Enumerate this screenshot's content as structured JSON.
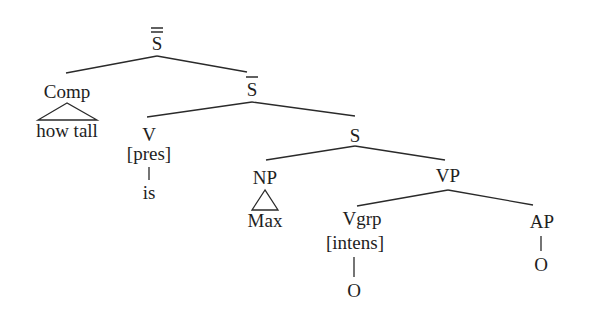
{
  "diagram": {
    "type": "syntax-tree",
    "nodes": {
      "root": {
        "label": "S",
        "bars": 2
      },
      "comp": {
        "label": "Comp"
      },
      "comp_leaf": {
        "label": "how tall",
        "roof": true
      },
      "sbar": {
        "label": "S",
        "bars": 1
      },
      "v": {
        "label": "V"
      },
      "v_feature": {
        "label": "[pres]"
      },
      "v_leaf": {
        "label": "is"
      },
      "s": {
        "label": "S"
      },
      "np": {
        "label": "NP"
      },
      "np_leaf": {
        "label": "Max",
        "roof": true
      },
      "vp": {
        "label": "VP"
      },
      "vgrp": {
        "label": "Vgrp"
      },
      "vgrp_feature": {
        "label": "[intens]"
      },
      "vgrp_leaf": {
        "label": "O"
      },
      "ap": {
        "label": "AP"
      },
      "ap_leaf": {
        "label": "O"
      }
    },
    "edges": [
      [
        "root",
        "comp"
      ],
      [
        "root",
        "sbar"
      ],
      [
        "comp",
        "comp_leaf"
      ],
      [
        "sbar",
        "v"
      ],
      [
        "sbar",
        "s"
      ],
      [
        "v",
        "v_leaf"
      ],
      [
        "s",
        "np"
      ],
      [
        "s",
        "vp"
      ],
      [
        "np",
        "np_leaf"
      ],
      [
        "vp",
        "vgrp"
      ],
      [
        "vp",
        "ap"
      ],
      [
        "vgrp",
        "vgrp_leaf"
      ],
      [
        "ap",
        "ap_leaf"
      ]
    ]
  }
}
